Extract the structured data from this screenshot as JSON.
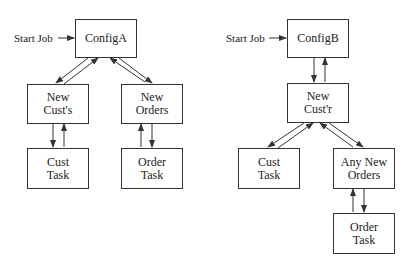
{
  "left_diagram": {
    "start_label": "Start Job",
    "config": "ConfigA",
    "nodes": {
      "new_cust": [
        "New",
        "Cust's"
      ],
      "new_orders": [
        "New",
        "Orders"
      ],
      "cust_task": [
        "Cust",
        "Task"
      ],
      "order_task": [
        "Order",
        "Task"
      ]
    }
  },
  "right_diagram": {
    "start_label": "Start Job",
    "config": "ConfigB",
    "nodes": {
      "new_custr": [
        "New",
        "Cust'r"
      ],
      "cust_task": [
        "Cust",
        "Task"
      ],
      "any_new_orders": [
        "Any New",
        "Orders"
      ],
      "order_task": [
        "Order",
        "Task"
      ]
    }
  },
  "colors": {
    "line": "#333333",
    "background": "#ffffff"
  }
}
